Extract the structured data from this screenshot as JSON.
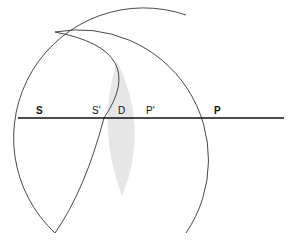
{
  "diagram": {
    "type": "geometric construction - intersecting circular arcs on a line",
    "fill_color": "#e6e6e6",
    "stroke_color": "#333333",
    "labels": {
      "s": "S",
      "s_prime": "S'",
      "d": "D",
      "p_prime": "P'",
      "p": "P"
    }
  }
}
